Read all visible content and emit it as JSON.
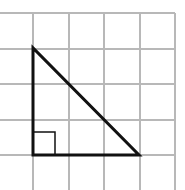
{
  "diagram": {
    "type": "grid-with-right-triangle",
    "background": "#ffffff",
    "grid": {
      "color": "#b8b8b8",
      "line_width": 2,
      "vertical_lines_x": [
        33,
        69,
        104,
        140,
        175
      ],
      "horizontal_lines_y": [
        13,
        49,
        84,
        120,
        155
      ],
      "extent": {
        "x_min": 0,
        "x_max": 175,
        "y_min": 13,
        "y_max": 190
      }
    },
    "triangle": {
      "stroke": "#111111",
      "stroke_width": 3,
      "vertices": [
        [
          33,
          48
        ],
        [
          33,
          155
        ],
        [
          139,
          155
        ]
      ],
      "legs_in_cells": {
        "vertical": 3,
        "horizontal": 3
      }
    },
    "right_angle_marker": {
      "stroke": "#111111",
      "stroke_width": 1.5,
      "x": 33,
      "y": 132,
      "size": 22
    }
  }
}
